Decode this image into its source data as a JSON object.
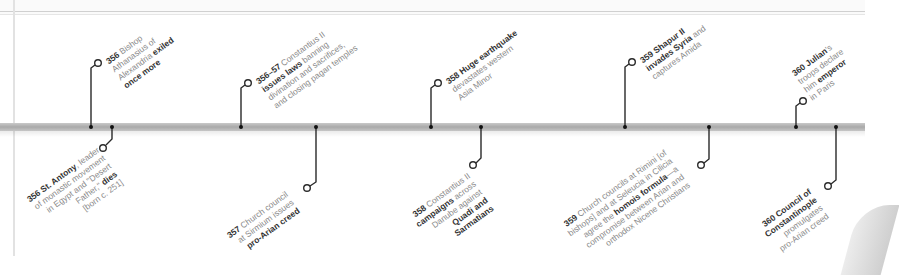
{
  "timeline": {
    "accent": "#333333",
    "bar_color": "#b5b5b5",
    "events_above": [
      {
        "year": "356",
        "lines": [
          [
            {
              "t": "356",
              "b": true
            },
            {
              "t": " Bishop"
            }
          ],
          [
            {
              "t": "Athanasius of"
            }
          ],
          [
            {
              "t": "Alexandria "
            },
            {
              "t": "exiled",
              "b": true
            }
          ],
          [
            {
              "t": "once more",
              "b": true
            }
          ]
        ]
      },
      {
        "year": "356–57",
        "lines": [
          [
            {
              "t": "356–57",
              "b": true
            },
            {
              "t": " Constantius II"
            }
          ],
          [
            {
              "t": "issues laws",
              "b": true
            },
            {
              "t": " banning"
            }
          ],
          [
            {
              "t": "divination and sacrifices,"
            }
          ],
          [
            {
              "t": "and closing pagan temples"
            }
          ]
        ]
      },
      {
        "year": "358",
        "lines": [
          [
            {
              "t": "358 Huge earthquake",
              "b": true
            }
          ],
          [
            {
              "t": "devastates western"
            }
          ],
          [
            {
              "t": "Asia Minor"
            }
          ]
        ]
      },
      {
        "year": "359",
        "lines": [
          [
            {
              "t": "359 Shapur II",
              "b": true
            }
          ],
          [
            {
              "t": "invades Syria",
              "b": true
            },
            {
              "t": " and"
            }
          ],
          [
            {
              "t": "captures Amida"
            }
          ]
        ]
      },
      {
        "year": "360",
        "lines": [
          [
            {
              "t": "360 Julian",
              "b": true
            },
            {
              "t": "'s"
            }
          ],
          [
            {
              "t": "troops declare"
            }
          ],
          [
            {
              "t": "him "
            },
            {
              "t": "emperor",
              "b": true
            }
          ],
          [
            {
              "t": "in Paris"
            }
          ]
        ]
      }
    ],
    "events_below": [
      {
        "year": "356",
        "lines": [
          [
            {
              "t": "356 St. Antony",
              "b": true
            },
            {
              "t": ", leader"
            }
          ],
          [
            {
              "t": "of monastic movement"
            }
          ],
          [
            {
              "t": "in Egypt and \"Desert"
            }
          ],
          [
            {
              "t": "Father,\" "
            },
            {
              "t": "dies",
              "b": true
            }
          ],
          [
            {
              "t": "[born c. 251]"
            }
          ]
        ]
      },
      {
        "year": "357",
        "lines": [
          [
            {
              "t": "357",
              "b": true
            },
            {
              "t": " Church council"
            }
          ],
          [
            {
              "t": "at Sirmium issues"
            }
          ],
          [
            {
              "t": "pro-Arian creed",
              "b": true
            }
          ]
        ]
      },
      {
        "year": "358",
        "lines": [
          [
            {
              "t": "358",
              "b": true
            },
            {
              "t": " Constantius II"
            }
          ],
          [
            {
              "t": "campaigns",
              "b": true
            },
            {
              "t": " across"
            }
          ],
          [
            {
              "t": "Danube against"
            }
          ],
          [
            {
              "t": "Quadi and",
              "b": true
            }
          ],
          [
            {
              "t": "Sarmatians",
              "b": true
            }
          ]
        ]
      },
      {
        "year": "359",
        "lines": [
          [
            {
              "t": "359",
              "b": true
            },
            {
              "t": " Church councils at Rimini [of"
            }
          ],
          [
            {
              "t": "bishops] and at Seleucia in Cilicia"
            }
          ],
          [
            {
              "t": "agree the "
            },
            {
              "t": "homois formula",
              "b": true
            },
            {
              "t": "—a"
            }
          ],
          [
            {
              "t": "compromise between Arian and"
            }
          ],
          [
            {
              "t": "orthodox Nicene Christians"
            }
          ]
        ]
      },
      {
        "year": "360",
        "lines": [
          [
            {
              "t": "360 Council of",
              "b": true
            }
          ],
          [
            {
              "t": "Constantinople",
              "b": true
            }
          ],
          [
            {
              "t": "promulgates"
            }
          ],
          [
            {
              "t": "pro-Arian creed"
            }
          ]
        ]
      }
    ]
  }
}
